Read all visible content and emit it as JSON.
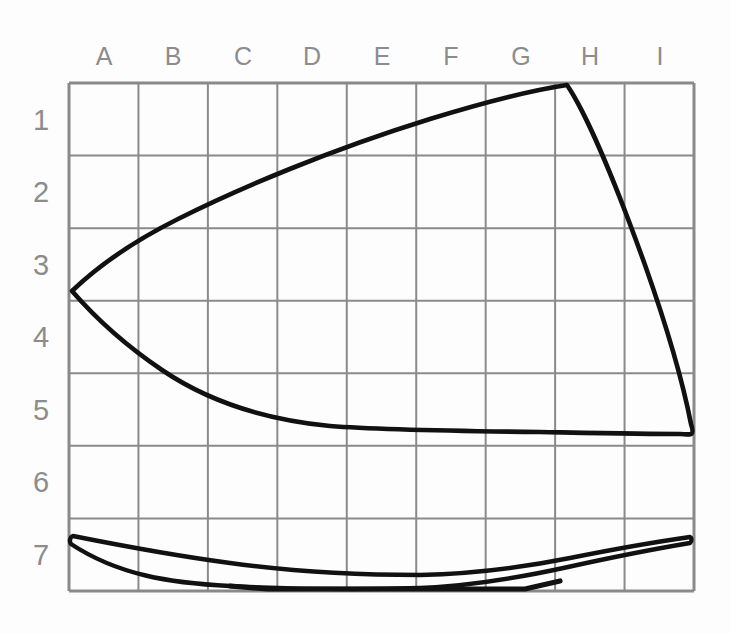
{
  "figure": {
    "background_color": "#fdfdfd",
    "grid_color": "#8a8a8a",
    "outline_color": "#111111",
    "label_color": "#8c8c8c"
  },
  "grid": {
    "left": 69,
    "top": 83,
    "right": 694,
    "bottom": 591,
    "columns": 9,
    "rows": 7,
    "column_labels": [
      "A",
      "B",
      "C",
      "D",
      "E",
      "F",
      "G",
      "H",
      "I"
    ],
    "row_labels": [
      "1",
      "2",
      "3",
      "4",
      "5",
      "6",
      "7"
    ]
  },
  "chart_data": {
    "type": "line",
    "xlabel": "",
    "ylabel": "",
    "grid": true,
    "legend": "none",
    "x_categories": [
      "A",
      "B",
      "C",
      "D",
      "E",
      "F",
      "G",
      "H",
      "I"
    ],
    "y_categories": [
      "1",
      "2",
      "3",
      "4",
      "5",
      "6",
      "7"
    ],
    "xlim": [
      0,
      9
    ],
    "ylim": [
      7,
      0
    ],
    "series": [
      {
        "name": "body-upper-edge",
        "comment": "From left tip at column A / row 3.5 rising to apex near column H / row 0",
        "points": [
          [
            0.04,
            2.88
          ],
          [
            0.55,
            2.35
          ],
          [
            1.3,
            1.85
          ],
          [
            2.3,
            1.42
          ],
          [
            3.5,
            1.05
          ],
          [
            5.0,
            0.62
          ],
          [
            6.4,
            0.22
          ],
          [
            7.18,
            0.03
          ]
        ]
      },
      {
        "name": "body-right-edge",
        "comment": "Steep right side of the iron from apex down to the heel",
        "points": [
          [
            7.18,
            0.03
          ],
          [
            7.75,
            1.3
          ],
          [
            8.4,
            2.9
          ],
          [
            8.8,
            4.25
          ],
          [
            8.98,
            4.78
          ]
        ]
      },
      {
        "name": "body-lower-edge",
        "comment": "Concave sweep from left tip back to the heel at row 4.8",
        "points": [
          [
            0.04,
            2.88
          ],
          [
            0.9,
            3.35
          ],
          [
            2.0,
            3.95
          ],
          [
            3.2,
            4.45
          ],
          [
            4.6,
            4.76
          ],
          [
            6.2,
            4.83
          ],
          [
            8.0,
            4.83
          ],
          [
            8.98,
            4.8
          ]
        ]
      },
      {
        "name": "soleplate-top-edge",
        "comment": "Thin base plate, upper contour",
        "points": [
          [
            0.02,
            6.23
          ],
          [
            1.0,
            6.46
          ],
          [
            2.3,
            6.62
          ],
          [
            3.6,
            6.74
          ],
          [
            5.0,
            6.79
          ],
          [
            6.3,
            6.64
          ],
          [
            7.6,
            6.38
          ],
          [
            8.62,
            6.22
          ]
        ]
      },
      {
        "name": "soleplate-bottom-edge",
        "comment": "Thin base plate, lower contour resting on the baseline",
        "points": [
          [
            0.02,
            6.29
          ],
          [
            1.1,
            6.58
          ],
          [
            2.3,
            6.78
          ],
          [
            2.9,
            6.97
          ],
          [
            5.05,
            6.97
          ],
          [
            5.4,
            6.88
          ],
          [
            6.6,
            6.68
          ],
          [
            7.8,
            6.42
          ],
          [
            8.62,
            6.27
          ]
        ]
      }
    ]
  }
}
